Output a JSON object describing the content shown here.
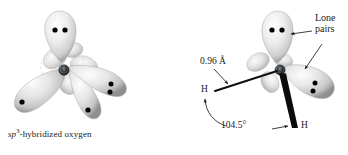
{
  "figure": {
    "background_color": "#ffffff",
    "ink_color": "#1a1a1a",
    "lobe_color": "#e8e8e8",
    "lobe_shadow_color": "#9a9a9a",
    "electron_dot_color": "#000000"
  },
  "left_panel": {
    "caption_prefix": "sp",
    "caption_superscript": "3",
    "caption_suffix": "-hybridized oxygen",
    "center_atom_label": "O",
    "orbitals": [
      {
        "name": "top-lobe",
        "electron_dots": 2,
        "kind": "lone-pair"
      },
      {
        "name": "left-lobe",
        "electron_dots": 1,
        "kind": "single-electron"
      },
      {
        "name": "right-lobe",
        "electron_dots": 2,
        "kind": "lone-pair"
      },
      {
        "name": "bottom-lobe",
        "electron_dots": 1,
        "kind": "single-electron"
      }
    ]
  },
  "right_panel": {
    "center_atom_label": "O",
    "hydrogen_left_label": "H",
    "hydrogen_right_label": "H",
    "bond_length_label": "0.96 Å",
    "bond_angle_label": "104.5°",
    "lone_pairs_label_line1": "Lone",
    "lone_pairs_label_line2": "pairs",
    "orbitals": [
      {
        "name": "top-lobe",
        "electron_dots": 2,
        "kind": "lone-pair"
      },
      {
        "name": "right-lobe",
        "electron_dots": 2,
        "kind": "lone-pair"
      }
    ],
    "bonds": [
      {
        "name": "o-h-plain-bond",
        "style": "line"
      },
      {
        "name": "o-h-wedge-bond",
        "style": "solid-wedge"
      }
    ]
  }
}
